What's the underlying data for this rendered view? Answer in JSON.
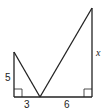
{
  "diagram": {
    "labels": {
      "left_height": "5",
      "left_base": "3",
      "right_base": "6",
      "right_height": "x"
    },
    "stroke_color": "#222222"
  }
}
